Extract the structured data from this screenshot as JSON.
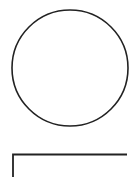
{
  "canvas": {
    "width": 138,
    "height": 193,
    "background": "#ffffff"
  },
  "shapes": {
    "circle": {
      "cx": 70,
      "cy": 68,
      "r": 58,
      "stroke": "#222222",
      "stroke_width": 1.6,
      "fill": "none"
    },
    "corner_bracket": {
      "points": "13,177 13,154.5 127,154.5",
      "stroke": "#222222",
      "stroke_width": 1.8,
      "fill": "none"
    }
  }
}
